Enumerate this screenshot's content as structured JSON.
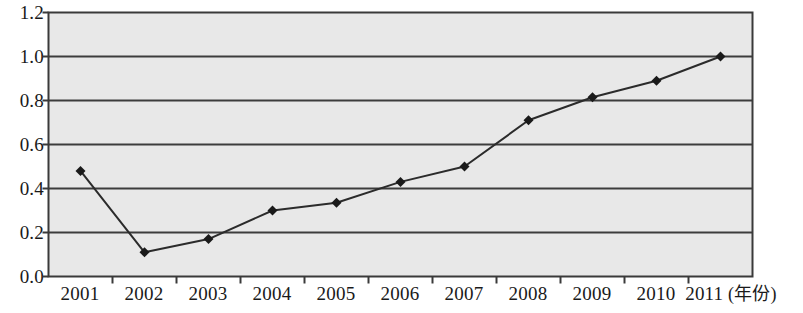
{
  "chart_data": {
    "type": "line",
    "title": "",
    "subtitle": "",
    "xlabel": "(年份)",
    "ylabel": "",
    "categories": [
      "2001",
      "2002",
      "2003",
      "2004",
      "2005",
      "2006",
      "2007",
      "2008",
      "2009",
      "2010",
      "2011"
    ],
    "values": [
      0.48,
      0.11,
      0.17,
      0.3,
      0.335,
      0.43,
      0.5,
      0.71,
      0.815,
      0.89,
      1.0
    ],
    "series": [
      {
        "name": "",
        "values": [
          0.48,
          0.11,
          0.17,
          0.3,
          0.335,
          0.43,
          0.5,
          0.71,
          0.815,
          0.89,
          1.0
        ]
      }
    ],
    "ylim": [
      0.0,
      1.2
    ],
    "y_ticks": [
      "0.0",
      "0.2",
      "0.4",
      "0.6",
      "0.8",
      "1.0",
      "1.2"
    ],
    "y_tick_values": [
      0.0,
      0.2,
      0.4,
      0.6,
      0.8,
      1.0,
      1.2
    ],
    "gridlines": [
      0.2,
      0.4,
      0.6,
      0.8,
      1.0
    ],
    "grid": true,
    "legend": false,
    "legend_position": "none",
    "marker": "diamond",
    "annotations": []
  },
  "style": {
    "plot_background": "#e8e8e8",
    "frame_color": "#3a3a3a",
    "grid_color": "#3c3c3c",
    "line_color": "#2b2b2b",
    "marker_color": "#1a1a1a",
    "text_color": "#1a1a1a",
    "page_background": "#ffffff"
  },
  "axis": {
    "x_unit_label": "(年份)"
  }
}
